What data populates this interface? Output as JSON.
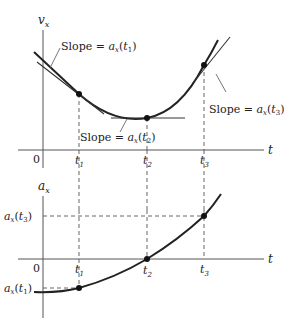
{
  "top_graph": {
    "y_axis_label": "v",
    "y_axis_sub": "x",
    "x_axis_label": "t",
    "origin_label": "0",
    "ticks": [
      {
        "label": "t",
        "sub": "1"
      },
      {
        "label": "t",
        "sub": "2"
      },
      {
        "label": "t",
        "sub": "3"
      }
    ],
    "annotations": [
      {
        "prefix": "Slope = ",
        "func": "a",
        "func_sub": "x",
        "arg": "t",
        "arg_sub": "1"
      },
      {
        "prefix": "Slope = ",
        "func": "a",
        "func_sub": "x",
        "arg": "t",
        "arg_sub": "2"
      },
      {
        "prefix": "Slope = ",
        "func": "a",
        "func_sub": "x",
        "arg": "t",
        "arg_sub": "3"
      }
    ]
  },
  "bottom_graph": {
    "y_axis_label": "a",
    "y_axis_sub": "x",
    "x_axis_label": "t",
    "origin_label": "0",
    "ticks": [
      {
        "label": "t",
        "sub": "1"
      },
      {
        "label": "t",
        "sub": "2"
      },
      {
        "label": "t",
        "sub": "3"
      }
    ],
    "y_labels": [
      {
        "func": "a",
        "func_sub": "x",
        "arg": "t",
        "arg_sub": "3"
      },
      {
        "func": "a",
        "func_sub": "x",
        "arg": "t",
        "arg_sub": "1"
      }
    ]
  }
}
